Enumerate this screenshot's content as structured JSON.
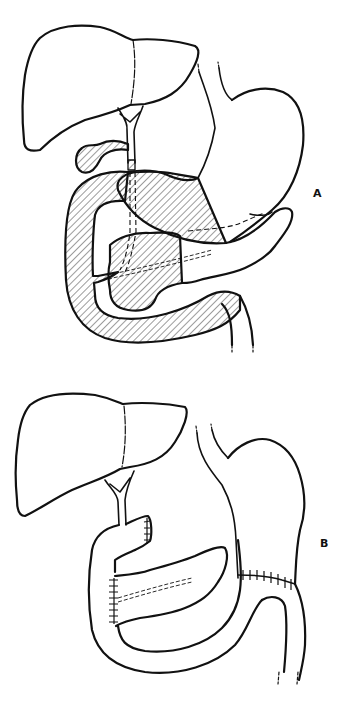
{
  "figure": {
    "panels": [
      {
        "id": "A",
        "label": "A",
        "structures": [
          "liver",
          "bile-duct",
          "gallbladder",
          "stomach",
          "esophagus",
          "duodenum",
          "pancreas",
          "jejunum"
        ],
        "hatched_region": "resected specimen: distal stomach, gallbladder, distal bile duct, duodenum, pancreatic head"
      },
      {
        "id": "B",
        "label": "B",
        "structures": [
          "liver",
          "bile-duct",
          "jejunal-loop",
          "pancreatic-remnant",
          "stomach-remnant",
          "esophagus",
          "efferent-jejunum"
        ],
        "anastomoses": [
          "choledochojejunostomy",
          "pancreaticojejunostomy",
          "gastrojejunostomy"
        ]
      }
    ],
    "colors": {
      "line": "#111111",
      "background": "#ffffff"
    }
  }
}
